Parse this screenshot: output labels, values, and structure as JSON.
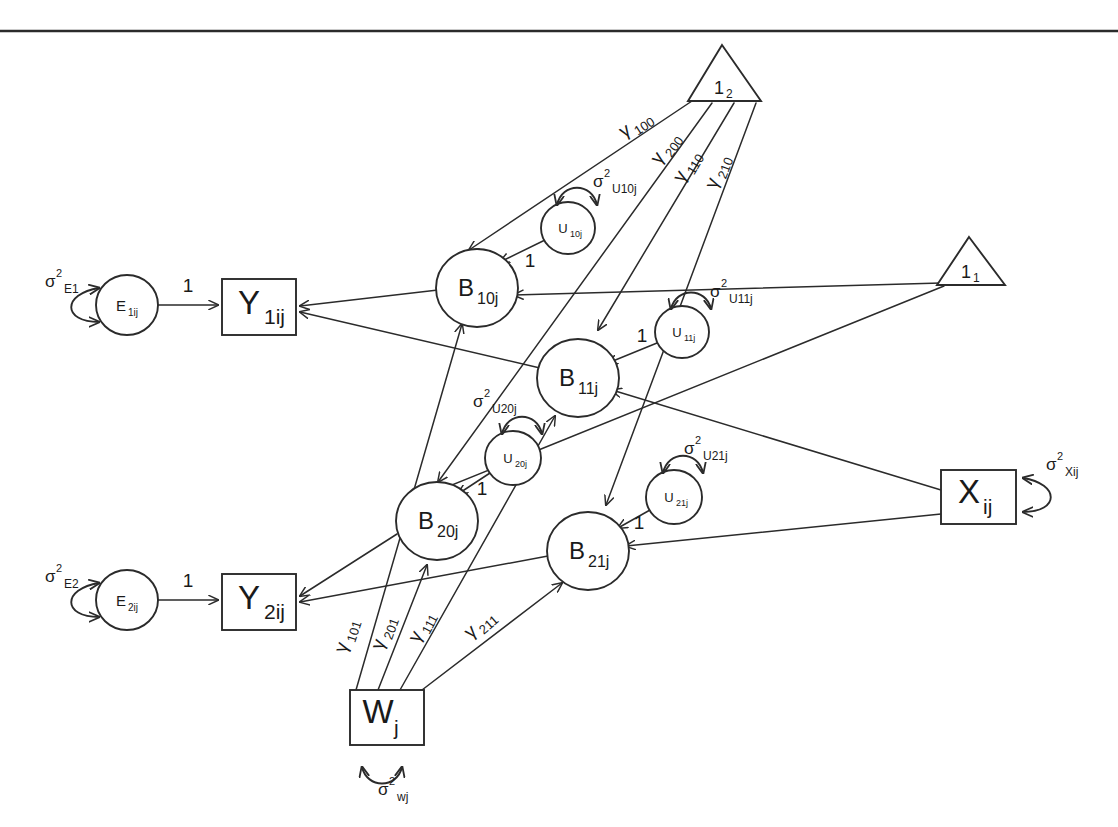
{
  "diagram": {
    "background_color": "#ffffff",
    "stroke_color": "#2b2b2b",
    "width": 1118,
    "height": 827
  },
  "observed_variables": [
    {
      "id": "Y1",
      "base": "Y",
      "sub": "1ij",
      "shape": "rectangle"
    },
    {
      "id": "Y2",
      "base": "Y",
      "sub": "2ij",
      "shape": "rectangle"
    },
    {
      "id": "X",
      "base": "X",
      "sub": "ij",
      "shape": "rectangle"
    },
    {
      "id": "W",
      "base": "W",
      "sub": "j",
      "shape": "rectangle"
    }
  ],
  "latent_variables": [
    {
      "id": "B10j",
      "base": "B",
      "sub": "10j",
      "shape": "circle"
    },
    {
      "id": "B11j",
      "base": "B",
      "sub": "11j",
      "shape": "circle"
    },
    {
      "id": "B20j",
      "base": "B",
      "sub": "20j",
      "shape": "circle"
    },
    {
      "id": "B21j",
      "base": "B",
      "sub": "21j",
      "shape": "circle"
    }
  ],
  "residual_variables": [
    {
      "id": "E1ij",
      "base": "E",
      "sub": "1ij",
      "shape": "circle"
    },
    {
      "id": "E2ij",
      "base": "E",
      "sub": "2ij",
      "shape": "circle"
    },
    {
      "id": "U10j",
      "base": "U",
      "sub": "10j",
      "shape": "circle"
    },
    {
      "id": "U11j",
      "base": "U",
      "sub": "11j",
      "shape": "circle"
    },
    {
      "id": "U20j",
      "base": "U",
      "sub": "20j",
      "shape": "circle"
    },
    {
      "id": "U21j",
      "base": "U",
      "sub": "21j",
      "shape": "circle"
    }
  ],
  "constants": [
    {
      "id": "one_level2",
      "base": "1",
      "sub": "2",
      "shape": "triangle"
    },
    {
      "id": "one_level1",
      "base": "1",
      "sub": "1",
      "shape": "triangle"
    }
  ],
  "variances": [
    {
      "id": "var_E1",
      "symbol": "σ",
      "sup": "2",
      "sub": "E1"
    },
    {
      "id": "var_E2",
      "symbol": "σ",
      "sup": "2",
      "sub": "E2"
    },
    {
      "id": "var_U10j",
      "symbol": "σ",
      "sup": "2",
      "sub": "U10j"
    },
    {
      "id": "var_U11j",
      "symbol": "σ",
      "sup": "2",
      "sub": "U11j"
    },
    {
      "id": "var_U20j",
      "symbol": "σ",
      "sup": "2",
      "sub": "U20j"
    },
    {
      "id": "var_U21j",
      "symbol": "σ",
      "sup": "2",
      "sub": "U21j"
    },
    {
      "id": "var_Xij",
      "symbol": "σ",
      "sup": "2",
      "sub": "Xij"
    },
    {
      "id": "var_wj",
      "symbol": "σ",
      "sup": "2",
      "sub": "wj"
    }
  ],
  "path_coefficients": [
    {
      "id": "g100",
      "symbol": "γ",
      "sub": "100",
      "from": "one_level2",
      "to": "B10j"
    },
    {
      "id": "g200",
      "symbol": "γ",
      "sub": "200",
      "from": "one_level2",
      "to": "B20j"
    },
    {
      "id": "g110",
      "symbol": "γ",
      "sub": "110",
      "from": "one_level2",
      "to": "B11j"
    },
    {
      "id": "g210",
      "symbol": "γ",
      "sub": "210",
      "from": "one_level2",
      "to": "B21j"
    },
    {
      "id": "g101",
      "symbol": "γ",
      "sub": "101",
      "from": "W",
      "to": "B10j"
    },
    {
      "id": "g201",
      "symbol": "γ",
      "sub": "201",
      "from": "W",
      "to": "B20j"
    },
    {
      "id": "g111",
      "symbol": "γ",
      "sub": "111",
      "from": "W",
      "to": "B11j"
    },
    {
      "id": "g211",
      "symbol": "γ",
      "sub": "211",
      "from": "W",
      "to": "B21j"
    }
  ],
  "fixed_loadings": [
    {
      "id": "load_E1_Y1",
      "value": "1",
      "from": "E1ij",
      "to": "Y1"
    },
    {
      "id": "load_E2_Y2",
      "value": "1",
      "from": "E2ij",
      "to": "Y2"
    },
    {
      "id": "load_U10_B10",
      "value": "1",
      "from": "U10j",
      "to": "B10j"
    },
    {
      "id": "load_U11_B11",
      "value": "1",
      "from": "U11j",
      "to": "B11j"
    },
    {
      "id": "load_U20_B20",
      "value": "1",
      "from": "U20j",
      "to": "B20j"
    },
    {
      "id": "load_U21_B21",
      "value": "1",
      "from": "U21j",
      "to": "B21j"
    }
  ]
}
